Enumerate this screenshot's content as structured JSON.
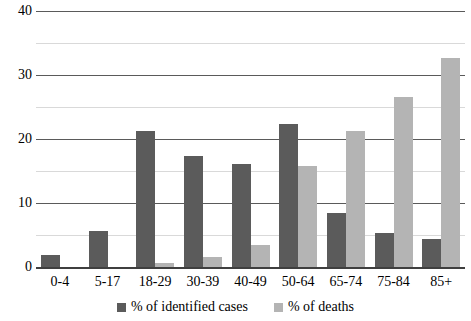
{
  "chart_data": {
    "type": "bar",
    "title": "",
    "subtitle": "",
    "xlabel": "",
    "ylabel": "",
    "ylim": [
      0,
      40
    ],
    "y_ticks": [
      0,
      10,
      20,
      30,
      40
    ],
    "y_minor_ticks": [
      5,
      15,
      25,
      35
    ],
    "grid": true,
    "legend_position": "bottom",
    "categories": [
      "0-4",
      "5-17",
      "18-29",
      "30-39",
      "40-49",
      "50-64",
      "65-74",
      "75-84",
      "85+"
    ],
    "series": [
      {
        "name": "% of identified cases",
        "color": "#5b5b5b",
        "values": [
          1.8,
          5.6,
          21.2,
          17.3,
          16.1,
          22.3,
          8.4,
          5.3,
          4.3
        ]
      },
      {
        "name": "% of deaths",
        "color": "#b4b4b4",
        "values": [
          0,
          0,
          0.6,
          1.5,
          3.4,
          15.8,
          21.2,
          26.5,
          32.7
        ]
      }
    ]
  },
  "legend": {
    "items": [
      {
        "label": "% of identified cases",
        "swatch": "legend-swatch-identified-cases"
      },
      {
        "label": "% of deaths",
        "swatch": "legend-swatch-deaths"
      }
    ]
  },
  "axes": {
    "y_tick_labels": [
      "40",
      "30",
      "20",
      "10",
      "0"
    ],
    "x_tick_labels": [
      "0-4",
      "5-17",
      "18-29",
      "30-39",
      "40-49",
      "50-64",
      "65-74",
      "75-84",
      "85+"
    ]
  }
}
